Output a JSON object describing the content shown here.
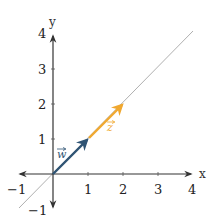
{
  "diagram": {
    "type": "vector-plot",
    "axes": {
      "x_label": "x",
      "y_label": "y",
      "x_range": [
        -1,
        4
      ],
      "y_range": [
        -1,
        4
      ],
      "x_ticks": [
        "−1",
        "1",
        "2",
        "3",
        "4"
      ],
      "y_ticks": [
        "−1",
        "1",
        "2",
        "3",
        "4"
      ]
    },
    "line": {
      "equation": "y = x",
      "color": "#b0b0b0"
    },
    "vectors": [
      {
        "name": "w",
        "label": "w",
        "from": [
          0,
          0
        ],
        "to": [
          1,
          1
        ],
        "color": "#2f5474"
      },
      {
        "name": "z",
        "label": "z",
        "from": [
          1,
          1
        ],
        "to": [
          2,
          2
        ],
        "color": "#f0a830"
      }
    ],
    "colors": {
      "axis": "#333333",
      "line": "#b0b0b0",
      "w": "#2f5474",
      "z": "#f0a830"
    }
  }
}
